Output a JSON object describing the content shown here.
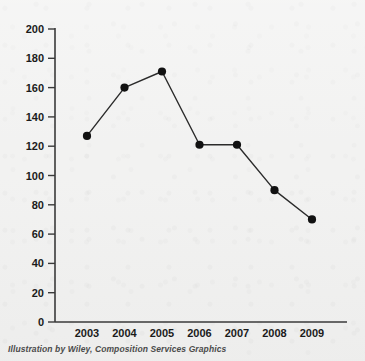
{
  "caption": "Illustration by Wiley, Composition Services Graphics",
  "colors": {
    "background": "#f2f2f1",
    "axis": "#3a3a3a",
    "line": "#2b2b2b",
    "marker": "#111111",
    "label": "#1b1b1b",
    "caption": "#4a4a4a"
  },
  "chart_data": {
    "type": "line",
    "title": "",
    "xlabel": "",
    "ylabel": "",
    "categories": [
      "2003",
      "2004",
      "2005",
      "2006",
      "2007",
      "2008",
      "2009"
    ],
    "values": [
      127,
      160,
      171,
      121,
      121,
      90,
      70
    ],
    "ylim": [
      0,
      200
    ],
    "yticks": [
      0,
      20,
      40,
      60,
      80,
      100,
      120,
      140,
      160,
      180,
      200
    ],
    "ytick_labels": [
      "0",
      "20",
      "40",
      "60",
      "80",
      "100",
      "120",
      "140",
      "160",
      "180",
      "200"
    ],
    "xtick_labels": [
      "2003",
      "2004",
      "2005",
      "2006",
      "2007",
      "2008",
      "2009"
    ],
    "grid": false,
    "legend": null,
    "markers": "filled-circle",
    "series": [
      {
        "name": "series-1",
        "values": [
          127,
          160,
          171,
          121,
          121,
          90,
          70
        ]
      }
    ]
  }
}
